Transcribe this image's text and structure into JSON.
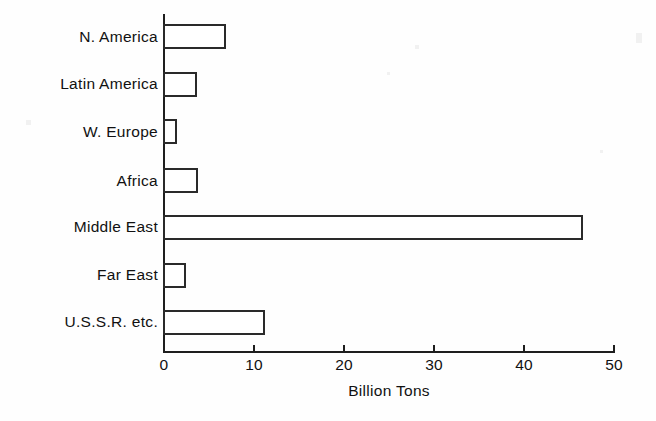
{
  "chart_data": {
    "type": "bar",
    "orientation": "horizontal",
    "title": "",
    "subtitle": "",
    "xlabel": "Billion Tons",
    "ylabel": "",
    "categories": [
      "N. America",
      "Latin America",
      "W. Europe",
      "Africa",
      "Middle East",
      "Far East",
      "U.S.S.R. etc."
    ],
    "values": [
      7.0,
      3.8,
      1.6,
      3.9,
      46.5,
      2.5,
      11.3
    ],
    "xlim": [
      0,
      50
    ],
    "xticks": [
      0,
      10,
      20,
      30,
      40,
      50
    ],
    "xtick_labels": [
      "0",
      "10",
      "20",
      "30",
      "40",
      "50"
    ],
    "grid": false,
    "legend": null,
    "bar_style": {
      "fill": "#ffffff",
      "edge": "#2a2a2a"
    }
  },
  "axis": {
    "x_title": "Billion Tons",
    "tick_labels": [
      "0",
      "10",
      "20",
      "30",
      "40",
      "50"
    ]
  },
  "categories": [
    {
      "label": "N. America",
      "value": 7.0
    },
    {
      "label": "Latin America",
      "value": 3.8
    },
    {
      "label": "W. Europe",
      "value": 1.6
    },
    {
      "label": "Africa",
      "value": 3.9
    },
    {
      "label": "Middle East",
      "value": 46.5
    },
    {
      "label": "Far East",
      "value": 2.5
    },
    {
      "label": "U.S.S.R. etc.",
      "value": 11.3
    }
  ],
  "colors": {
    "ink": "#1e1e1e",
    "bar_edge": "#2a2a2a",
    "bar_fill": "#ffffff",
    "background": "#fefefe"
  }
}
